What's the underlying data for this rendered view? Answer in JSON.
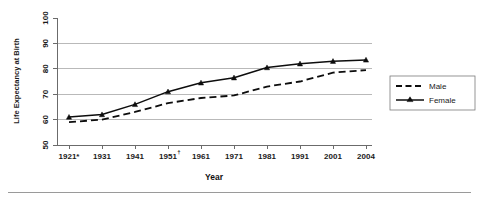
{
  "chart_data": {
    "type": "line",
    "title": "",
    "xlabel": "Year",
    "ylabel": "Life Expectancy at Birth",
    "categories": [
      "1921*",
      "1931",
      "1941",
      "1951",
      "1961",
      "1971",
      "1981",
      "1991",
      "2001",
      "2004"
    ],
    "category_superscripts": [
      "*",
      "",
      "",
      "†",
      "",
      "",
      "",
      "",
      "",
      ""
    ],
    "ylim": [
      50,
      100
    ],
    "yticks": [
      50,
      60,
      70,
      80,
      90,
      100
    ],
    "ytick_labels": [
      "50",
      "60",
      "70",
      "80",
      "90",
      "100"
    ],
    "grid": "horizontal",
    "legend_position": "right",
    "series": [
      {
        "name": "Male",
        "style": "dashed",
        "marker": "none",
        "color": "#0d0d0d",
        "values": [
          59,
          60,
          63,
          66.5,
          68.5,
          69.5,
          73,
          75,
          78.5,
          79.5
        ]
      },
      {
        "name": "Female",
        "style": "solid",
        "marker": "triangle",
        "color": "#0d0d0d",
        "values": [
          61,
          62,
          66,
          71,
          74.5,
          76.5,
          80.5,
          82,
          83,
          83.5
        ]
      }
    ]
  },
  "legend": {
    "items": [
      {
        "label": "Male"
      },
      {
        "label": "Female"
      }
    ]
  },
  "axis": {
    "y_title": "Life Expectancy at Birth",
    "x_title": "Year"
  }
}
